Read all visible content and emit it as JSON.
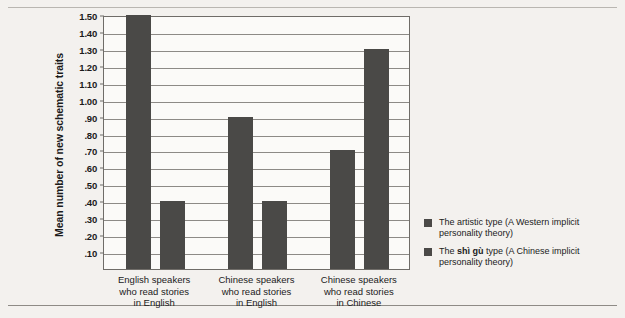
{
  "chart_data": {
    "type": "bar",
    "title": "",
    "xlabel": "",
    "ylabel": "Mean number of new schematic traits",
    "ylim": [
      0,
      1.5
    ],
    "grid": true,
    "legend_position": "right",
    "categories": [
      "English speakers\nwho read stories\nin English",
      "Chinese speakers\nwho read stories\nin English",
      "Chinese speakers\nwho read stories\nin Chinese"
    ],
    "category_lines": [
      [
        "English speakers",
        "who read stories",
        "in English"
      ],
      [
        "Chinese speakers",
        "who read stories",
        "in English"
      ],
      [
        "Chinese speakers",
        "who read stories",
        "in Chinese"
      ]
    ],
    "series": [
      {
        "name": "The artistic type (A Western implicit personality theory)",
        "values": [
          1.5,
          0.9,
          0.7
        ],
        "color": "#4a4947"
      },
      {
        "name": "The shì gù type (A Chinese implicit personality theory)",
        "values": [
          0.4,
          0.4,
          1.3
        ],
        "color": "#4a4947"
      }
    ],
    "yticks": [
      "1.50",
      "1.40",
      "1.30",
      "1.20",
      "1.10",
      "1.00",
      ".90",
      ".80",
      ".70",
      ".60",
      ".50",
      ".40",
      ".30",
      ".20",
      ".10"
    ],
    "ytick_values": [
      1.5,
      1.4,
      1.3,
      1.2,
      1.1,
      1.0,
      0.9,
      0.8,
      0.7,
      0.6,
      0.5,
      0.4,
      0.3,
      0.2,
      0.1
    ]
  },
  "legend": {
    "items": [
      {
        "prefix": "The artistic type (A Western implicit personality theory)",
        "bold": "",
        "suffix": ""
      },
      {
        "prefix": "The ",
        "bold": "shì gù",
        "suffix": " type (A Chinese implicit personality theory)"
      }
    ]
  },
  "colors": {
    "bar": "#4a4947",
    "background": "#f3f1ee",
    "plot_background": "#fbfaf8",
    "axis": "#6f6c68",
    "grid": "#8d8a86"
  }
}
